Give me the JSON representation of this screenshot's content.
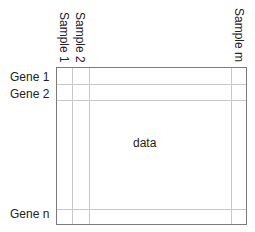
{
  "diagram": {
    "type": "gene expression data matrix",
    "column_labels": [
      "Sample 1",
      "Sample 2",
      "Sample m"
    ],
    "row_labels": [
      "Gene 1",
      "Gene 2",
      "Gene n"
    ],
    "center_label": "data",
    "colors": {
      "border": "#7a7a7a",
      "grid": "#c8c8c8",
      "text": "#222222",
      "background": "#ffffff"
    }
  }
}
